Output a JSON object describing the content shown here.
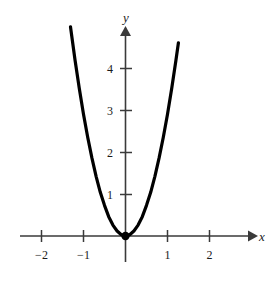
{
  "chart_data": {
    "type": "line",
    "title": "",
    "subtitle": "",
    "xlabel": "x",
    "ylabel": "y",
    "xlim": [
      -2.6,
      3.0
    ],
    "ylim": [
      -0.9,
      5.2
    ],
    "grid": false,
    "legend": null,
    "xticks": [
      -2,
      -1,
      1,
      2
    ],
    "xtick_labels": [
      "−2",
      "−1",
      "1",
      "2"
    ],
    "yticks": [
      1,
      2,
      3,
      4
    ],
    "ytick_labels": [
      "1",
      "2",
      "3",
      "4"
    ],
    "axis_arrows": {
      "x": "right",
      "y": "up"
    },
    "series": [
      {
        "name": "parabola",
        "equation": "y = 2.9x^2",
        "coefficient": 2.9,
        "color": "#000000",
        "line_width": 3.2,
        "x_domain": [
          -1.31,
          1.26
        ],
        "points": [
          {
            "x": -1.31,
            "y": 4.98
          },
          {
            "x": -1.2,
            "y": 4.18
          },
          {
            "x": -1.1,
            "y": 3.51
          },
          {
            "x": -1.0,
            "y": 2.9
          },
          {
            "x": -0.9,
            "y": 2.35
          },
          {
            "x": -0.8,
            "y": 1.86
          },
          {
            "x": -0.7,
            "y": 1.42
          },
          {
            "x": -0.6,
            "y": 1.04
          },
          {
            "x": -0.5,
            "y": 0.73
          },
          {
            "x": -0.4,
            "y": 0.46
          },
          {
            "x": -0.3,
            "y": 0.26
          },
          {
            "x": -0.2,
            "y": 0.12
          },
          {
            "x": -0.1,
            "y": 0.03
          },
          {
            "x": 0.0,
            "y": 0.0
          },
          {
            "x": 0.1,
            "y": 0.03
          },
          {
            "x": 0.2,
            "y": 0.12
          },
          {
            "x": 0.3,
            "y": 0.26
          },
          {
            "x": 0.4,
            "y": 0.46
          },
          {
            "x": 0.5,
            "y": 0.73
          },
          {
            "x": 0.6,
            "y": 1.04
          },
          {
            "x": 0.7,
            "y": 1.42
          },
          {
            "x": 0.8,
            "y": 1.86
          },
          {
            "x": 0.9,
            "y": 2.35
          },
          {
            "x": 1.0,
            "y": 2.9
          },
          {
            "x": 1.1,
            "y": 3.51
          },
          {
            "x": 1.2,
            "y": 4.18
          },
          {
            "x": 1.26,
            "y": 4.6
          }
        ]
      }
    ],
    "markers": [
      {
        "name": "vertex",
        "x": 0,
        "y": 0,
        "style": "filled-circle",
        "color": "#000000"
      }
    ],
    "colors": {
      "curve": "#000000",
      "axis": "#3a3a3a",
      "text": "#1a1a1a",
      "background": "#ffffff"
    }
  },
  "labels": {
    "x_axis": "x",
    "y_axis": "y",
    "x_neg2": "−2",
    "x_neg1": "−1",
    "x_pos1": "1",
    "x_pos2": "2",
    "y_1": "1",
    "y_2": "2",
    "y_3": "3",
    "y_4": "4"
  }
}
